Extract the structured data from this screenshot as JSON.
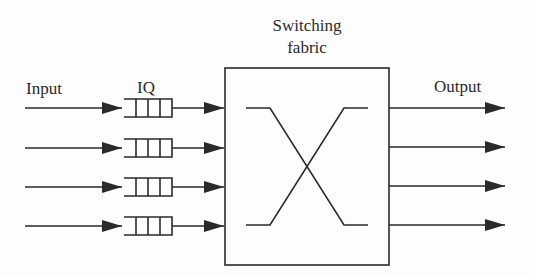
{
  "diagram": {
    "type": "input-queued switch",
    "labels": {
      "input": "Input",
      "iq": "IQ",
      "fabric_line1": "Switching",
      "fabric_line2": "fabric",
      "output": "Output"
    },
    "ports": 4,
    "queue_cells_per_port": 3,
    "colors": {
      "stroke": "#2a2a2a",
      "background": "#fdfdfd"
    },
    "nodes": [
      {
        "id": "input",
        "label": "Input"
      },
      {
        "id": "iq-1",
        "label": "IQ",
        "port": 1
      },
      {
        "id": "iq-2",
        "port": 2
      },
      {
        "id": "iq-3",
        "port": 3
      },
      {
        "id": "iq-4",
        "port": 4
      },
      {
        "id": "switching-fabric",
        "label": "Switching fabric"
      },
      {
        "id": "output",
        "label": "Output"
      }
    ],
    "edges": [
      {
        "from": "input",
        "to": "iq-1"
      },
      {
        "from": "input",
        "to": "iq-2"
      },
      {
        "from": "input",
        "to": "iq-3"
      },
      {
        "from": "input",
        "to": "iq-4"
      },
      {
        "from": "iq-1",
        "to": "switching-fabric"
      },
      {
        "from": "iq-2",
        "to": "switching-fabric"
      },
      {
        "from": "iq-3",
        "to": "switching-fabric"
      },
      {
        "from": "iq-4",
        "to": "switching-fabric"
      },
      {
        "from": "switching-fabric",
        "to": "output",
        "port": 1
      },
      {
        "from": "switching-fabric",
        "to": "output",
        "port": 2
      },
      {
        "from": "switching-fabric",
        "to": "output",
        "port": 3
      },
      {
        "from": "switching-fabric",
        "to": "output",
        "port": 4
      }
    ],
    "crossbar": "port 1 connected to port 4 and port 4 connected to port 1 (X pattern)"
  }
}
